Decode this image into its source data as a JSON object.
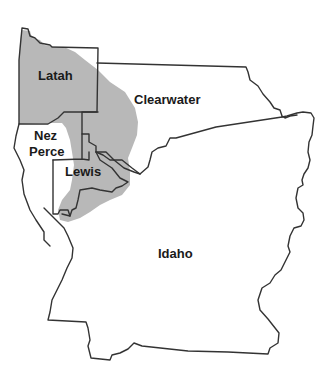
{
  "map": {
    "type": "county-map",
    "region_shading_color": "#b8b8b8",
    "boundary_color": "#333333",
    "background_color": "#ffffff",
    "counties": [
      {
        "name": "Latah",
        "label": "Latah",
        "shaded": true
      },
      {
        "name": "Clearwater",
        "label": "Clearwater",
        "shaded": "partial"
      },
      {
        "name": "Nez Perce",
        "label_line1": "Nez",
        "label_line2": "Perce",
        "shaded": "partial"
      },
      {
        "name": "Lewis",
        "label": "Lewis",
        "shaded": "partial"
      },
      {
        "name": "Idaho",
        "label": "Idaho",
        "shaded": "partial"
      }
    ]
  }
}
